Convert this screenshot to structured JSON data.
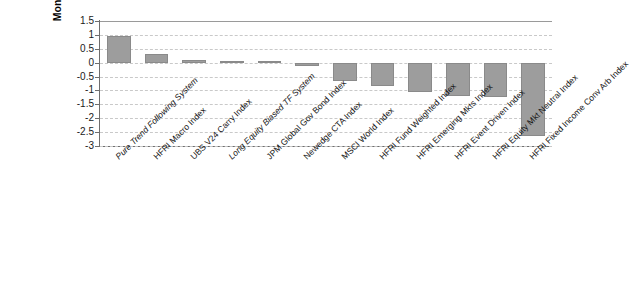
{
  "chart_data": {
    "type": "bar",
    "title": "",
    "subtitle": "",
    "xlabel": "",
    "ylabel": "Monthly Return Skew",
    "ylim": [
      -3,
      1.5
    ],
    "yticks": [
      1.5,
      1,
      0.5,
      0,
      -0.5,
      -1,
      -1.5,
      -2,
      -2.5,
      -3
    ],
    "ytick_labels": [
      "1.5",
      "1",
      "0.5",
      "0",
      "-0.5",
      "-1",
      "-1.5",
      "-2",
      "-2.5",
      "-3"
    ],
    "grid": true,
    "grid_style": "dashed-horizontal",
    "legend": null,
    "bar_color": "#9d9d9d",
    "categories": [
      "Pure Trend Following System",
      "HFRI Macro Index",
      "UBS V24 Carry Index",
      "Long Equity Biased TF System",
      "JPM Global Gov Bond Index",
      "Newedge CTA Index",
      "MSCI World Index",
      "HFRI Fund Weighted Index",
      "HFRI Emerging Mkts Index",
      "HFRI Event Driven Index",
      "HFRI Equity Mkt Neutral Index",
      "HFRI Fixed Income Conv Arb Index"
    ],
    "category_styles": [
      "italic",
      "normal",
      "normal",
      "italic",
      "normal",
      "normal",
      "normal",
      "normal",
      "normal",
      "normal",
      "normal",
      "normal"
    ],
    "values": [
      0.95,
      0.3,
      0.1,
      0.06,
      0.05,
      -0.12,
      -0.65,
      -0.85,
      -1.05,
      -1.2,
      -1.25,
      -2.65
    ]
  }
}
